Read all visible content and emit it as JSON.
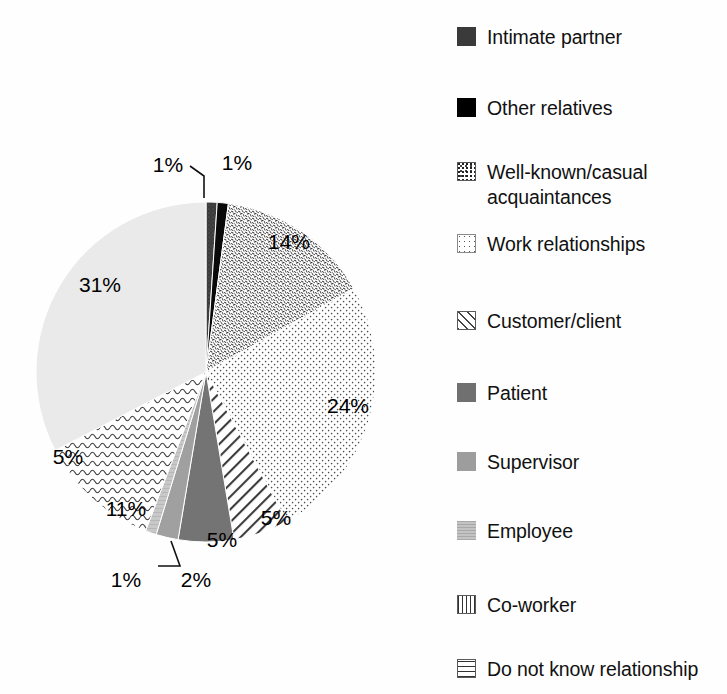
{
  "chart_data": {
    "type": "pie",
    "title": "",
    "subtitle": "",
    "xlabel": "",
    "ylabel": "",
    "legend_position": "right",
    "grid": false,
    "start_angle_deg": 0,
    "direction": "clockwise",
    "categories": [
      "Intimate partner",
      "Other relatives",
      "Well-known/casual acquaintances",
      "Work relationships",
      "Customer/client",
      "Patient",
      "Supervisor",
      "Employee",
      "Co-worker",
      "Do not know relationship"
    ],
    "values": [
      1,
      1,
      14,
      24,
      5,
      5,
      2,
      1,
      11,
      31
    ],
    "value_labels": [
      "1%",
      "1%",
      "14%",
      "24%",
      "5%",
      "5%",
      "2%",
      "1%",
      "11%",
      "31%"
    ],
    "slice_patterns": [
      "dark-gray-speckle",
      "solid-black",
      "dense-confetti-speckle",
      "fine-dots",
      "diagonal-stripes",
      "solid-dark-gray",
      "solid-medium-gray",
      "solid-light-gray",
      "wavy-lines",
      "solid-very-light-gray"
    ],
    "slice_colors": [
      "#3a3a3a",
      "#000000",
      "#ffffff",
      "#ffffff",
      "#ffffff",
      "#707070",
      "#9d9d9d",
      "#c9c9c9",
      "#ffffff",
      "#e8e8e8"
    ],
    "labels_with_leader_lines": [
      "1%",
      "1%"
    ]
  },
  "pie": {
    "center_x": 206,
    "center_y": 372,
    "radius": 170,
    "slices": [
      {
        "label": "Intimate partner",
        "value": 1,
        "text": "1%",
        "pattern": "intimate",
        "label_mode": "leader-left",
        "label_x": 168,
        "label_y": 166,
        "leader": "M 204 198 L 204 176 L 190 166"
      },
      {
        "label": "Other relatives",
        "value": 1,
        "text": "1%",
        "pattern": "other",
        "label_mode": "outside",
        "label_x": 237,
        "label_y": 164
      },
      {
        "label": "Well-known/casual acquaintances",
        "value": 14,
        "text": "14%",
        "pattern": "wellknown",
        "label_mode": "inside",
        "label_x": 289,
        "label_y": 243
      },
      {
        "label": "Work relationships",
        "value": 24,
        "text": "24%",
        "pattern": "work",
        "label_mode": "inside",
        "label_x": 348,
        "label_y": 407
      },
      {
        "label": "Customer/client",
        "value": 5,
        "text": "5%",
        "pattern": "customer",
        "label_mode": "inside",
        "label_x": 276,
        "label_y": 519
      },
      {
        "label": "Patient",
        "value": 5,
        "text": "5%",
        "pattern": "patient",
        "label_mode": "inside",
        "label_x": 222,
        "label_y": 541
      },
      {
        "label": "Supervisor",
        "value": 2,
        "text": "2%",
        "pattern": "supervisor",
        "label_mode": "outside",
        "label_x": 196,
        "label_y": 581
      },
      {
        "label": "Employee",
        "value": 1,
        "text": "1%",
        "pattern": "employee",
        "label_mode": "leader-left",
        "label_x": 126,
        "label_y": 581,
        "leader": "M 171 541 L 180 566 L 158 566"
      },
      {
        "label": "Co-worker",
        "value": 11,
        "text": "11%",
        "pattern": "coworker",
        "label_mode": "inside",
        "label_x": 126,
        "label_y": 510
      },
      {
        "label": "Do not know relationship",
        "value": 31,
        "text": "31%",
        "pattern": "donotknow",
        "label_mode": "inside",
        "label_x": 100,
        "label_y": 286
      }
    ],
    "extra_labels": [
      {
        "text": "5%",
        "x": 68,
        "y": 458
      }
    ]
  },
  "legend": {
    "items": [
      {
        "label": "Intimate partner",
        "swatch": "sw-intimate",
        "icon": "swatch-dark-gray-speckle-icon",
        "top": 25
      },
      {
        "label": "Other relatives",
        "swatch": "sw-other",
        "icon": "swatch-solid-black-icon",
        "top": 96
      },
      {
        "label": "Well-known/casual\nacquaintances",
        "swatch": "sw-wellknown",
        "icon": "swatch-confetti-speckle-icon",
        "top": 160
      },
      {
        "label": "Work relationships",
        "swatch": "sw-work",
        "icon": "swatch-fine-dots-icon",
        "top": 232
      },
      {
        "label": "Customer/client",
        "swatch": "sw-customer",
        "icon": "swatch-diagonal-stripes-icon",
        "top": 309
      },
      {
        "label": "Patient",
        "swatch": "sw-patient",
        "icon": "swatch-dark-gray-icon",
        "top": 381
      },
      {
        "label": "Supervisor",
        "swatch": "sw-supervisor",
        "icon": "swatch-medium-gray-icon",
        "top": 450
      },
      {
        "label": "Employee",
        "swatch": "sw-employee",
        "icon": "swatch-light-gray-icon",
        "top": 519
      },
      {
        "label": "Co-worker",
        "swatch": "sw-coworker",
        "icon": "swatch-zigzag-icon",
        "top": 593
      },
      {
        "label": "Do not know relationship",
        "swatch": "sw-donotknow",
        "icon": "swatch-squiggle-icon",
        "top": 657
      }
    ]
  }
}
